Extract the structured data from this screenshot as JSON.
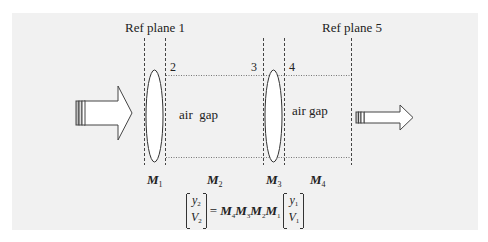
{
  "diagram": {
    "ref_planes": [
      {
        "label": "Ref plane 1"
      },
      {
        "label": "Ref plane 5"
      }
    ],
    "plane_numbers": [
      "2",
      "3",
      "4"
    ],
    "gaps": [
      {
        "label": "air  gap"
      },
      {
        "label": "air gap"
      }
    ],
    "matrices": [
      {
        "symbol": "M",
        "sub": "1"
      },
      {
        "symbol": "M",
        "sub": "2"
      },
      {
        "symbol": "M",
        "sub": "3"
      },
      {
        "symbol": "M",
        "sub": "4"
      }
    ],
    "equation": {
      "lhs": {
        "top": "y",
        "top_sub": "2",
        "bottom": "V",
        "bottom_sub": "2"
      },
      "equals": "=",
      "product": [
        {
          "symbol": "M",
          "sub": "4"
        },
        {
          "symbol": "M",
          "sub": "3"
        },
        {
          "symbol": "M",
          "sub": "2"
        },
        {
          "symbol": "M",
          "sub": "1"
        }
      ],
      "rhs": {
        "top": "y",
        "top_sub": "1",
        "bottom": "V",
        "bottom_sub": "1"
      }
    },
    "arrows": [
      {
        "name": "input-arrow",
        "direction": "right"
      },
      {
        "name": "output-arrow",
        "direction": "right"
      }
    ],
    "colors": {
      "panel": "#f1f1f1",
      "stroke": "#333333",
      "arrow_fill": "#ffffff"
    }
  }
}
